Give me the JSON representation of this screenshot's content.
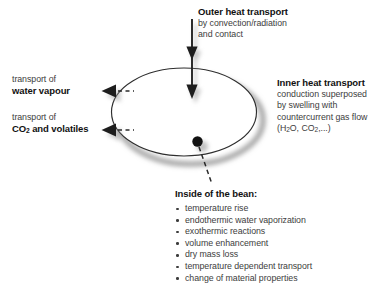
{
  "diagram": {
    "title_semantic": "coffee-bean-roasting-heat-and-mass-transport",
    "colors": {
      "background": "#ffffff",
      "heading_text": "#111111",
      "body_text": "#3d3d3d",
      "stroke": "#2b2b2b",
      "bean_fill": "#ffffff",
      "shadow": "#9a9a9a"
    }
  },
  "outer_heat": {
    "heading": "Outer heat transport",
    "lines": [
      "by convection/radiation",
      "and contact"
    ]
  },
  "inner_heat": {
    "heading": "Inner heat transport",
    "lines": [
      "conduction superposed",
      "by swelling with",
      "countercurrent gas flow"
    ],
    "formula_prefix": "(H",
    "formula_sub1": "2",
    "formula_mid": "O, CO",
    "formula_sub2": "2",
    "formula_suffix": ",...)"
  },
  "water_vapour": {
    "line1": "transport of",
    "line2": "water vapour"
  },
  "co2_volatiles": {
    "line1": "transport of",
    "label_prefix": "CO",
    "label_sub": "2",
    "label_suffix": " and volatiles"
  },
  "bean_interior": {
    "heading": "Inside of the bean:",
    "items": [
      "temperature rise",
      "endothermic water vaporization",
      "exothermic reactions",
      "volume enhancement",
      "dry mass loss",
      "temperature dependent transport",
      "change of material properties"
    ]
  }
}
